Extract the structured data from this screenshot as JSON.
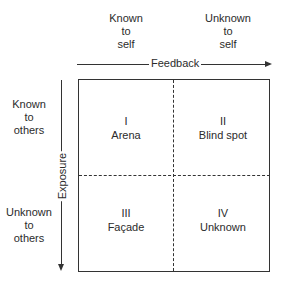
{
  "columns": [
    {
      "line1": "Known",
      "line2": "to",
      "line3": "self"
    },
    {
      "line1": "Unknown",
      "line2": "to",
      "line3": "self"
    }
  ],
  "rows": [
    {
      "line1": "Known",
      "line2": "to",
      "line3": "others"
    },
    {
      "line1": "Unknown",
      "line2": "to",
      "line3": "others"
    }
  ],
  "axes": {
    "horizontal": "Feedback",
    "vertical": "Exposure"
  },
  "quadrants": [
    {
      "numeral": "I",
      "name": "Arena"
    },
    {
      "numeral": "II",
      "name": "Blind spot"
    },
    {
      "numeral": "III",
      "name": "Façade"
    },
    {
      "numeral": "IV",
      "name": "Unknown"
    }
  ],
  "colors": {
    "line": "#333333",
    "text": "#2b2b2b",
    "background": "#ffffff"
  }
}
